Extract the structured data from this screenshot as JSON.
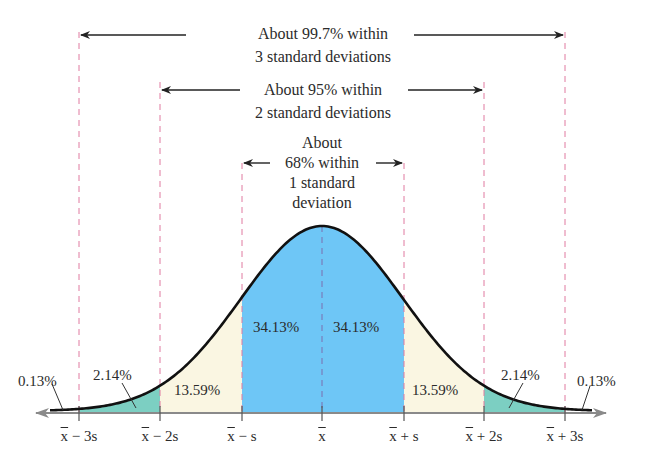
{
  "chart_data": {
    "type": "area",
    "title": "",
    "xlabel": "",
    "ylabel": "",
    "categories": [
      "x̄ − 3s",
      "x̄ − 2s",
      "x̄ − s",
      "x̄",
      "x̄ + s",
      "x̄ + 2s",
      "x̄ + 3s"
    ],
    "regions": [
      {
        "from": "beyond x̄ − 3s",
        "to": "x̄ − 3s",
        "percent": 0.13,
        "label": "0.13%",
        "color": "#ffffff"
      },
      {
        "from": "x̄ − 3s",
        "to": "x̄ − 2s",
        "percent": 2.14,
        "label": "2.14%",
        "color": "#7ccfc2"
      },
      {
        "from": "x̄ − 2s",
        "to": "x̄ − s",
        "percent": 13.59,
        "label": "13.59%",
        "color": "#faf6e2"
      },
      {
        "from": "x̄ − s",
        "to": "x̄",
        "percent": 34.13,
        "label": "34.13%",
        "color": "#6ec6f6"
      },
      {
        "from": "x̄",
        "to": "x̄ + s",
        "percent": 34.13,
        "label": "34.13%",
        "color": "#6ec6f6"
      },
      {
        "from": "x̄ + s",
        "to": "x̄ + 2s",
        "percent": 13.59,
        "label": "13.59%",
        "color": "#faf6e2"
      },
      {
        "from": "x̄ + 2s",
        "to": "x̄ + 3s",
        "percent": 2.14,
        "label": "2.14%",
        "color": "#7ccfc2"
      },
      {
        "from": "x̄ + 3s",
        "to": "beyond x̄ + 3s",
        "percent": 0.13,
        "label": "0.13%",
        "color": "#ffffff"
      }
    ],
    "annotations": [
      {
        "span": "±3s",
        "text": "About 99.7% within 3 standard deviations"
      },
      {
        "span": "±2s",
        "text": "About 95% within 2 standard deviations"
      },
      {
        "span": "±1s",
        "text": "About 68% within 1 standard deviation"
      }
    ],
    "grid": false,
    "legend": "none"
  },
  "annotations": {
    "three_sd": {
      "line1": "About 99.7% within",
      "line2": "3 standard deviations"
    },
    "two_sd": {
      "line1": "About 95% within",
      "line2": "2 standard deviations"
    },
    "one_sd": {
      "line1": "About",
      "line2": "68% within",
      "line3": "1 standard",
      "line4": "deviation"
    }
  },
  "percent_labels": {
    "left_tail": "0.13%",
    "left_2": "2.14%",
    "left_1": "13.59%",
    "center_left": "34.13%",
    "center_right": "34.13%",
    "right_1": "13.59%",
    "right_2": "2.14%",
    "right_tail": "0.13%"
  },
  "ticks": {
    "m3": {
      "pre": "x",
      "post": " − 3s"
    },
    "m2": {
      "pre": "x",
      "post": " − 2s"
    },
    "m1": {
      "pre": "x",
      "post": " − s"
    },
    "mean": {
      "pre": "x",
      "post": ""
    },
    "p1": {
      "pre": "x",
      "post": " + s"
    },
    "p2": {
      "pre": "x",
      "post": " + 2s"
    },
    "p3": {
      "pre": "x",
      "post": " + 3s"
    }
  },
  "colors": {
    "center": "#6ec6f6",
    "middle": "#faf6e2",
    "outer": "#7ccfc2",
    "dash": "#e07aa0",
    "mean_dash": "#7a6fb0",
    "curve": "#111111",
    "axis": "#8a8a8a"
  }
}
